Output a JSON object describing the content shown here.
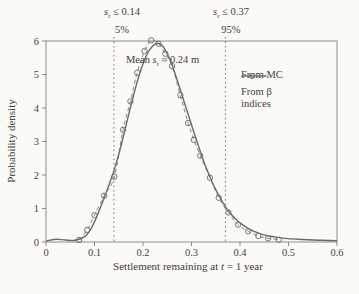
{
  "figure": {
    "ylabel": "Probability density",
    "xlabel": {
      "pre": "Settlement remaining at ",
      "var": "t",
      "post": " = 1 year"
    }
  },
  "annotations": {
    "q5": {
      "var": "s",
      "sub": "r",
      "cond": " ≤ 0.14",
      "pct": "5%"
    },
    "q95": {
      "var": "s",
      "sub": "r",
      "cond": " ≤ 0.37",
      "pct": "95%"
    },
    "mean": {
      "pre": "Mean ",
      "var": "s",
      "sub": "r",
      "post": " ≈ 0.24 m"
    }
  },
  "legend": {
    "items": [
      {
        "label": "From MC",
        "style": "solid"
      },
      {
        "label_line1": "From β",
        "label_line2": "indices",
        "style": "dash-circle"
      }
    ]
  },
  "colors": {
    "background": "#fbfaf6",
    "frame": "#8d8d87",
    "tick_text": "#45453f",
    "mc_line": "#6c6c66",
    "beta_line": "#82827b",
    "marker": "#76766f",
    "dotted_line": "#73736c"
  },
  "chart_data": {
    "type": "line",
    "title": "",
    "xlabel": "Settlement remaining at t = 1 year",
    "ylabel": "Probability density",
    "xlim": [
      0,
      0.6
    ],
    "ylim": [
      0,
      6
    ],
    "x_ticks": [
      0,
      0.1,
      0.2,
      0.3,
      0.4,
      0.5,
      0.6
    ],
    "y_ticks": [
      0,
      1,
      2,
      3,
      4,
      5,
      6
    ],
    "grid": false,
    "legend_position": "upper right",
    "annotations": {
      "quantile_5": {
        "x": 0.14,
        "label": "sr ≤ 0.14",
        "pct": "5%"
      },
      "quantile_95": {
        "x": 0.37,
        "label": "sr ≤ 0.37",
        "pct": "95%"
      },
      "mean": {
        "text": "Mean sr ≈ 0.24 m",
        "value_m": 0.24
      }
    },
    "series": [
      {
        "name": "From MC",
        "style": "solid",
        "points": [
          [
            0.0,
            0.03
          ],
          [
            0.02,
            0.08
          ],
          [
            0.04,
            0.06
          ],
          [
            0.06,
            0.05
          ],
          [
            0.08,
            0.16
          ],
          [
            0.09,
            0.33
          ],
          [
            0.1,
            0.6
          ],
          [
            0.11,
            0.95
          ],
          [
            0.12,
            1.32
          ],
          [
            0.13,
            1.72
          ],
          [
            0.14,
            2.12
          ],
          [
            0.15,
            2.62
          ],
          [
            0.16,
            3.18
          ],
          [
            0.17,
            3.78
          ],
          [
            0.18,
            4.35
          ],
          [
            0.19,
            4.88
          ],
          [
            0.2,
            5.32
          ],
          [
            0.21,
            5.65
          ],
          [
            0.22,
            5.85
          ],
          [
            0.23,
            5.93
          ],
          [
            0.24,
            5.86
          ],
          [
            0.25,
            5.62
          ],
          [
            0.26,
            5.28
          ],
          [
            0.27,
            4.85
          ],
          [
            0.28,
            4.4
          ],
          [
            0.29,
            3.95
          ],
          [
            0.3,
            3.5
          ],
          [
            0.31,
            3.05
          ],
          [
            0.32,
            2.62
          ],
          [
            0.33,
            2.22
          ],
          [
            0.34,
            1.88
          ],
          [
            0.35,
            1.56
          ],
          [
            0.36,
            1.3
          ],
          [
            0.37,
            1.05
          ],
          [
            0.38,
            0.86
          ],
          [
            0.39,
            0.7
          ],
          [
            0.4,
            0.57
          ],
          [
            0.42,
            0.38
          ],
          [
            0.44,
            0.26
          ],
          [
            0.46,
            0.18
          ],
          [
            0.48,
            0.13
          ],
          [
            0.5,
            0.1
          ],
          [
            0.52,
            0.08
          ],
          [
            0.55,
            0.06
          ],
          [
            0.6,
            0.04
          ]
        ]
      },
      {
        "name": "From β indices",
        "style": "dashed-circles",
        "points": [
          [
            0.068,
            0.06
          ],
          [
            0.085,
            0.36
          ],
          [
            0.1,
            0.8
          ],
          [
            0.12,
            1.38
          ],
          [
            0.141,
            1.95
          ],
          [
            0.159,
            3.35
          ],
          [
            0.174,
            4.2
          ],
          [
            0.188,
            5.05
          ],
          [
            0.203,
            5.7
          ],
          [
            0.217,
            6.02
          ],
          [
            0.232,
            5.92
          ],
          [
            0.246,
            5.62
          ],
          [
            0.26,
            5.25
          ],
          [
            0.277,
            4.38
          ],
          [
            0.293,
            3.55
          ],
          [
            0.305,
            3.05
          ],
          [
            0.318,
            2.58
          ],
          [
            0.338,
            1.92
          ],
          [
            0.356,
            1.32
          ],
          [
            0.376,
            0.88
          ],
          [
            0.396,
            0.52
          ],
          [
            0.417,
            0.32
          ],
          [
            0.438,
            0.18
          ],
          [
            0.458,
            0.11
          ],
          [
            0.48,
            0.07
          ]
        ]
      }
    ]
  }
}
